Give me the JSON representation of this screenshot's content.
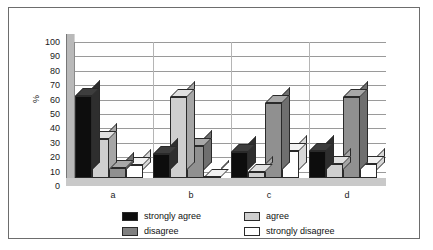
{
  "chart_data": {
    "type": "bar",
    "title": "",
    "xlabel": "",
    "ylabel": "%",
    "ylim": [
      0,
      100
    ],
    "yticks": [
      100,
      90,
      80,
      70,
      60,
      50,
      40,
      30,
      20,
      10,
      0
    ],
    "grid": true,
    "legend_position": "bottom",
    "categories": [
      "a",
      "b",
      "c",
      "d"
    ],
    "series": [
      {
        "name": "strongly agree",
        "color": "#0d0d0d",
        "values": [
          57,
          17,
          18,
          19
        ]
      },
      {
        "name": "agree",
        "color": "#cfcfcf",
        "values": [
          27,
          56,
          4,
          10
        ]
      },
      {
        "name": "disagree",
        "color": "#808080",
        "values": [
          7,
          22,
          52,
          56
        ]
      },
      {
        "name": "strongly disagree",
        "color": "#ffffff",
        "values": [
          9,
          1,
          19,
          10
        ]
      }
    ]
  },
  "axis": {
    "y_title": "%"
  },
  "legend": {
    "items": [
      {
        "label": "strongly agree"
      },
      {
        "label": "agree"
      },
      {
        "label": "disagree"
      },
      {
        "label": "strongly disagree"
      }
    ]
  }
}
